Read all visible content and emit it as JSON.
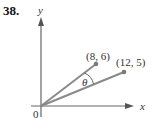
{
  "problem": {
    "number": "38."
  },
  "axes": {
    "x_label": "x",
    "y_label": "y",
    "origin_label": "0"
  },
  "points": [
    {
      "label": "(8, 6)",
      "x": 8,
      "y": 6
    },
    {
      "label": "(12, 5)",
      "x": 12,
      "y": 5
    }
  ],
  "angle": {
    "label": "θ"
  },
  "colors": {
    "vector": "#8a8a8a",
    "axis": "#555555",
    "point": "#7a7a7a"
  }
}
